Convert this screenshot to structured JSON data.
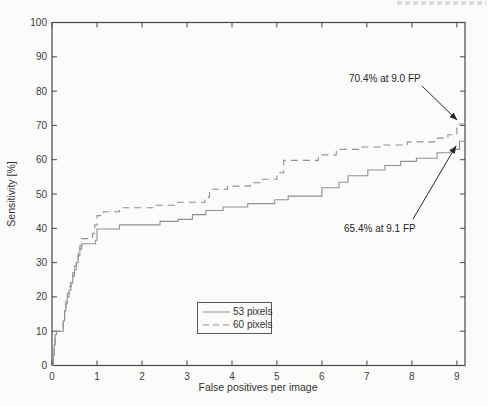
{
  "page": {
    "background": "#fbfbfa",
    "cropped_header_present": true
  },
  "chart_data": {
    "type": "line",
    "subtype": "FROC step curves",
    "title": "",
    "xlabel": "False positives per image",
    "ylabel": "Sensitivity [%]",
    "xlim": [
      0,
      9.18
    ],
    "ylim": [
      0,
      100
    ],
    "x_ticks": [
      0,
      1,
      2,
      3,
      4,
      5,
      6,
      7,
      8,
      9
    ],
    "y_ticks": [
      0,
      10,
      20,
      30,
      40,
      50,
      60,
      70,
      80,
      90,
      100
    ],
    "grid": false,
    "box": true,
    "axis_color": "#474747",
    "curve_color": "#919191",
    "legend_position": "inside-bottom-center",
    "series": [
      {
        "name": "53 pixels",
        "line_style": "solid",
        "points": [
          [
            0,
            0
          ],
          [
            0.03,
            3
          ],
          [
            0.05,
            6
          ],
          [
            0.07,
            9
          ],
          [
            0.1,
            10
          ],
          [
            0.25,
            13
          ],
          [
            0.28,
            16
          ],
          [
            0.31,
            18
          ],
          [
            0.34,
            20
          ],
          [
            0.38,
            22
          ],
          [
            0.42,
            24
          ],
          [
            0.46,
            26
          ],
          [
            0.5,
            28
          ],
          [
            0.54,
            30
          ],
          [
            0.58,
            32
          ],
          [
            0.62,
            34
          ],
          [
            0.66,
            35.5
          ],
          [
            0.97,
            36.5
          ],
          [
            1,
            39.8
          ],
          [
            1.5,
            41
          ],
          [
            2.4,
            42
          ],
          [
            2.8,
            42.6
          ],
          [
            3.12,
            44
          ],
          [
            3.42,
            45.2
          ],
          [
            3.8,
            46.2
          ],
          [
            4.35,
            47.2
          ],
          [
            4.95,
            48.3
          ],
          [
            5.25,
            49.4
          ],
          [
            6,
            51.8
          ],
          [
            6.38,
            53.4
          ],
          [
            6.58,
            55.3
          ],
          [
            7.02,
            57
          ],
          [
            7.4,
            58.3
          ],
          [
            7.75,
            59.5
          ],
          [
            8.1,
            60.4
          ],
          [
            8.56,
            62
          ],
          [
            8.85,
            63
          ],
          [
            9.06,
            65.4
          ]
        ]
      },
      {
        "name": "60 pixels",
        "line_style": "dashed",
        "points": [
          [
            0,
            0
          ],
          [
            0.03,
            3
          ],
          [
            0.05,
            6
          ],
          [
            0.07,
            9
          ],
          [
            0.1,
            10
          ],
          [
            0.25,
            13
          ],
          [
            0.28,
            16
          ],
          [
            0.31,
            19
          ],
          [
            0.34,
            21
          ],
          [
            0.38,
            23
          ],
          [
            0.42,
            25
          ],
          [
            0.46,
            27
          ],
          [
            0.5,
            29
          ],
          [
            0.54,
            31
          ],
          [
            0.58,
            33
          ],
          [
            0.62,
            35
          ],
          [
            0.66,
            37
          ],
          [
            0.9,
            38.5
          ],
          [
            0.95,
            41
          ],
          [
            1,
            43.7
          ],
          [
            1.15,
            44.8
          ],
          [
            1.5,
            46
          ],
          [
            2.25,
            46.7
          ],
          [
            2.8,
            47.6
          ],
          [
            3.4,
            49
          ],
          [
            3.5,
            51.4
          ],
          [
            3.9,
            52.3
          ],
          [
            4.4,
            53.3
          ],
          [
            4.62,
            54.3
          ],
          [
            5,
            56.2
          ],
          [
            5.15,
            59.8
          ],
          [
            5.92,
            61.4
          ],
          [
            6.32,
            63
          ],
          [
            6.9,
            63.7
          ],
          [
            7.3,
            64.3
          ],
          [
            7.9,
            65.2
          ],
          [
            8.5,
            66.3
          ],
          [
            8.8,
            67.3
          ],
          [
            9,
            70.4
          ]
        ]
      }
    ],
    "annotations": [
      {
        "text": "70.4% at 9.0 FP",
        "text_px": [
          349,
          82
        ],
        "arrow_from_px": [
          422,
          86
        ],
        "arrow_to_px": [
          457,
          120
        ]
      },
      {
        "text": "65.4% at 9.1 FP",
        "text_px": [
          344,
          232
        ],
        "arrow_from_px": [
          413,
          219
        ],
        "arrow_to_px": [
          456,
          146
        ]
      }
    ]
  }
}
